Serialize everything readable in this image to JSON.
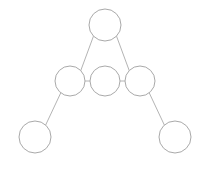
{
  "diagram": {
    "type": "node-link-graph",
    "canvas": {
      "width": 209,
      "height": 170,
      "background": "#ffffff"
    },
    "style": {
      "node_stroke": "#a9a9a9",
      "node_fill": "#ffffff",
      "node_stroke_width": 1,
      "edge_stroke": "#b4b4b4",
      "edge_stroke_width": 1
    },
    "nodes": [
      {
        "id": "apex",
        "label": "",
        "cx": 105,
        "cy": 25,
        "r": 16
      },
      {
        "id": "mid-left",
        "label": "",
        "cx": 70,
        "cy": 81,
        "r": 15
      },
      {
        "id": "mid-center",
        "label": "",
        "cx": 105,
        "cy": 81,
        "r": 15
      },
      {
        "id": "mid-right",
        "label": "",
        "cx": 140,
        "cy": 81,
        "r": 15
      },
      {
        "id": "bottom-left",
        "label": "",
        "cx": 35,
        "cy": 137,
        "r": 16
      },
      {
        "id": "bottom-right",
        "label": "",
        "cx": 175,
        "cy": 137,
        "r": 16
      }
    ],
    "edges": [
      {
        "id": "apex-to-mid-left",
        "from": "apex",
        "to": "mid-left",
        "x1": 93.5,
        "y1": 36.1,
        "x2": 80.8,
        "y2": 70.5
      },
      {
        "id": "apex-to-mid-right",
        "from": "apex",
        "to": "mid-right",
        "x1": 116.5,
        "y1": 36.1,
        "x2": 129.2,
        "y2": 70.5
      },
      {
        "id": "mid-left-to-mid-center",
        "from": "mid-left",
        "to": "mid-center",
        "x1": 85,
        "y1": 81,
        "x2": 90,
        "y2": 81
      },
      {
        "id": "mid-center-to-mid-right",
        "from": "mid-center",
        "to": "mid-right",
        "x1": 120,
        "y1": 81,
        "x2": 125,
        "y2": 81
      },
      {
        "id": "mid-left-to-bottom-left",
        "from": "mid-left",
        "to": "bottom-left",
        "x1": 60.8,
        "y1": 92.8,
        "x2": 45.3,
        "y2": 125.8
      },
      {
        "id": "mid-right-to-bottom-right",
        "from": "mid-right",
        "to": "bottom-right",
        "x1": 149.2,
        "y1": 92.8,
        "x2": 164.7,
        "y2": 125.8
      }
    ]
  }
}
